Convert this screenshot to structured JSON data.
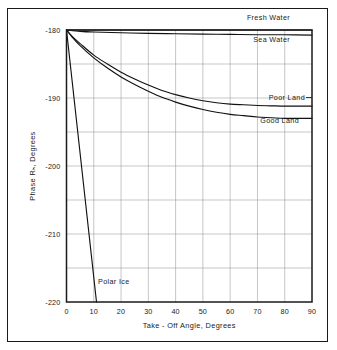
{
  "figure": {
    "background_color": "#ffffff",
    "frame_color": "#1a1a1a",
    "grid_color": "#8c8c8c",
    "curve_color": "#111111"
  },
  "chart_data": {
    "type": "line",
    "title": "",
    "subtitle": "",
    "xlabel": "Take - Off Angle, Degrees",
    "ylabel": "Phase Rₕ, Degrees",
    "ylabel_plain": "Phase R H, Degrees",
    "xlim": [
      0,
      90
    ],
    "ylim": [
      -220,
      -180
    ],
    "xticks": [
      0,
      10,
      20,
      30,
      40,
      50,
      60,
      70,
      80,
      90
    ],
    "xtick_labels": [
      "0",
      "10",
      "20",
      "30",
      "40",
      "50",
      "60",
      "70",
      "80",
      "90"
    ],
    "yticks": [
      -220,
      -210,
      -200,
      -190,
      -180
    ],
    "ytick_labels": [
      "-220",
      "-210",
      "-200",
      "-190",
      "-180"
    ],
    "y_minor_ticks": [
      -215,
      -205,
      -195,
      -185
    ],
    "grid": true,
    "grid_minor": true,
    "legend": "inline-labels",
    "legend_position": "right",
    "series": [
      {
        "name": "Fresh Water",
        "label": "Fresh Water",
        "label_position": "above-plot-right",
        "x": [
          0,
          5,
          10,
          20,
          30,
          40,
          50,
          60,
          70,
          80,
          90
        ],
        "values": [
          -180.0,
          -180.0,
          -180.0,
          -180.0,
          -180.0,
          -180.0,
          -180.0,
          -180.0,
          -180.0,
          -180.0,
          -180.0
        ]
      },
      {
        "name": "Sea Water",
        "label": "Sea Water",
        "label_position": "inside-top-right",
        "x": [
          0,
          5,
          10,
          20,
          30,
          40,
          50,
          60,
          70,
          80,
          90
        ],
        "values": [
          -180.0,
          -180.2,
          -180.3,
          -180.4,
          -180.5,
          -180.55,
          -180.6,
          -180.65,
          -180.7,
          -180.7,
          -180.75
        ]
      },
      {
        "name": "Poor Land",
        "label": "Poor Land",
        "label_position": "right",
        "x": [
          0,
          2,
          5,
          10,
          15,
          20,
          25,
          30,
          35,
          40,
          45,
          50,
          55,
          60,
          65,
          70,
          75,
          80,
          85,
          90
        ],
        "values": [
          -180.0,
          -180.9,
          -182.0,
          -183.7,
          -185.0,
          -186.2,
          -187.2,
          -188.1,
          -188.9,
          -189.5,
          -190.0,
          -190.4,
          -190.7,
          -190.9,
          -191.0,
          -191.1,
          -191.15,
          -191.2,
          -191.2,
          -191.2
        ]
      },
      {
        "name": "Good Land",
        "label": "Good Land",
        "label_position": "right",
        "x": [
          0,
          2,
          5,
          10,
          15,
          20,
          25,
          30,
          35,
          40,
          45,
          50,
          55,
          60,
          65,
          70,
          75,
          80,
          85,
          90
        ],
        "values": [
          -180.0,
          -181.0,
          -182.3,
          -184.1,
          -185.6,
          -186.9,
          -188.0,
          -189.0,
          -189.9,
          -190.6,
          -191.2,
          -191.7,
          -192.1,
          -192.4,
          -192.6,
          -192.8,
          -192.9,
          -193.0,
          -193.0,
          -193.0
        ]
      },
      {
        "name": "Polar Ice",
        "label": "Polar Ice",
        "label_position": "inside-lower-left",
        "x": [
          0,
          11
        ],
        "values": [
          -180.0,
          -220.0
        ]
      }
    ]
  }
}
